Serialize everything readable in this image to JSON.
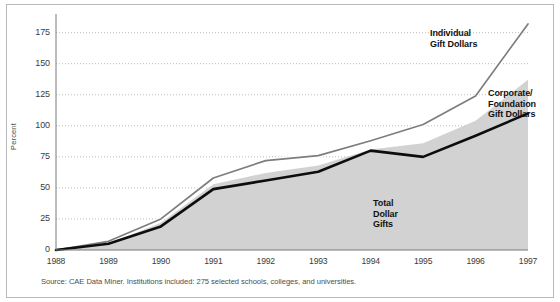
{
  "figure": {
    "width": 560,
    "height": 302,
    "background": "#ffffff",
    "border_color": "#b9b9b9"
  },
  "source_note": "Source: CAE Data Miner. Institutions included: 275 selected schools, colleges, and universities.",
  "annotations": {
    "individual": {
      "line1": "Individual",
      "line2": "Gift Dollars"
    },
    "corporate": {
      "line1": "Corporate/",
      "line2": "Foundation",
      "line3": "Gift Dollars"
    },
    "total": {
      "line1": "Total",
      "line2": "Dollar",
      "line3": "Gifts"
    }
  },
  "colors": {
    "individual_line": "#7d7d7d",
    "corporate_line": "#0d0d0d",
    "total_area": "#d2d2d2",
    "gridline": "#bdbdbd",
    "axis": "#7a7a7a",
    "tick_text": "#3c3c3c"
  },
  "chart_data": {
    "type": "line",
    "title": "",
    "subtitle": "",
    "xlabel": "",
    "ylabel": "Percent",
    "x": [
      1988,
      1989,
      1990,
      1991,
      1992,
      1993,
      1994,
      1995,
      1996,
      1997
    ],
    "categories": [
      "1988",
      "1989",
      "1990",
      "1991",
      "1992",
      "1993",
      "1994",
      "1995",
      "1996",
      "1997"
    ],
    "xtick_labels": [
      "1988",
      "1989",
      "1990",
      "1991",
      "1992",
      "1993",
      "1994",
      "1995",
      "1996",
      "1997"
    ],
    "ytick_labels": [
      "0",
      "25",
      "50",
      "75",
      "100",
      "125",
      "150",
      "175"
    ],
    "yticks": [
      0,
      25,
      50,
      75,
      100,
      125,
      150,
      175
    ],
    "ylim": [
      0,
      190
    ],
    "xlim": [
      1988,
      1997
    ],
    "grid": true,
    "grid_axis": "y",
    "grid_style": "dotted",
    "legend": "annotations-inline",
    "series": [
      {
        "name": "Individual Gift Dollars",
        "render": "line",
        "color": "#7d7d7d",
        "values": [
          0,
          7,
          25,
          58,
          72,
          76,
          88,
          101,
          124,
          182
        ]
      },
      {
        "name": "Total Dollar Gifts",
        "render": "area",
        "color": "#d2d2d2",
        "values": [
          0,
          5,
          22,
          53,
          62,
          68,
          81,
          86,
          104,
          137
        ]
      },
      {
        "name": "Corporate/Foundation Gift Dollars",
        "render": "line",
        "color": "#0d0d0d",
        "values": [
          0,
          5,
          19,
          49,
          56,
          63,
          80,
          75,
          92,
          110
        ]
      }
    ]
  }
}
